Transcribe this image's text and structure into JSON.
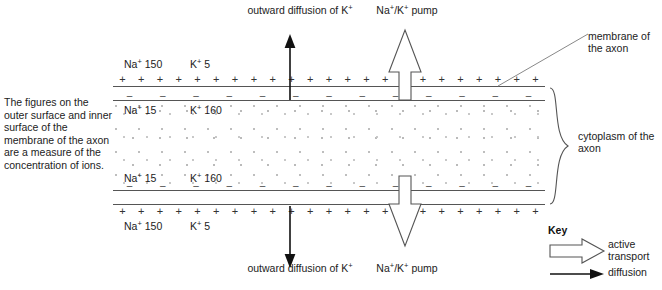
{
  "intro": {
    "text": "The figures on the outer surface and inner surface of the membrane of the axon are a measure of the concentration of ions."
  },
  "ions": {
    "outer_top_na": "Na⁺ 150",
    "outer_top_k": "K⁺ 5",
    "inner_top_na": "Na⁺ 15",
    "inner_top_k": "K⁺ 160",
    "inner_bottom_na": "Na⁺ 15",
    "inner_bottom_k": "K⁺ 160",
    "outer_bottom_na": "Na⁺ 150",
    "outer_bottom_k": "K⁺ 5"
  },
  "charges": {
    "outer_symbol": "+",
    "inner_symbol": "–",
    "outer_count": 23,
    "inner_count": 13
  },
  "annotations": {
    "diffusion_top": "outward diffusion of K⁺",
    "pump_top": "Na⁺/K⁺ pump",
    "diffusion_bottom": "outward diffusion of K⁺",
    "pump_bottom": "Na⁺/K⁺ pump",
    "membrane": "membrane of the axon",
    "cytoplasm": "cytoplasm of the axon"
  },
  "key": {
    "title": "Key",
    "active_transport": "active transport",
    "diffusion": "diffusion",
    "active_icon": "hollow-block-arrow-icon",
    "diffusion_icon": "solid-line-arrow-icon"
  },
  "colors": {
    "line": "#555555",
    "text": "#1a1a1a",
    "stipple": "#bdbdbd"
  }
}
